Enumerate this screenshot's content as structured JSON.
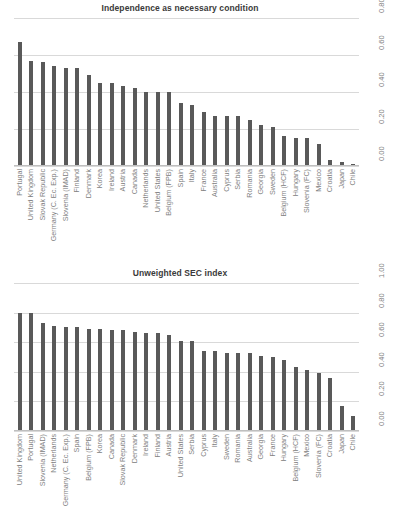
{
  "chart_data": [
    {
      "type": "bar",
      "title": "Independence as necessary condition",
      "xlabel": "",
      "ylabel": "",
      "ylim": [
        0.0,
        0.8
      ],
      "yticks": [
        "0.00",
        "0.20",
        "0.40",
        "0.60",
        "0.80"
      ],
      "ytick_values": [
        0.0,
        0.2,
        0.4,
        0.6,
        0.8
      ],
      "grid": true,
      "legend": "none",
      "bar_color": "#595959",
      "axis_position": "right",
      "categories": [
        "Portugal",
        "United Kingdom",
        "Slovak Republic",
        "Germany (C. Ec. Exp.)",
        "Slovenia (IMAD)",
        "Finland",
        "Denmark",
        "Korea",
        "Ireland",
        "Austria",
        "Canada",
        "Netherlands",
        "United States",
        "Belgium (FPB)",
        "Spain",
        "Italy",
        "France",
        "Australia",
        "Cyprus",
        "Serbia",
        "Romania",
        "Georgia",
        "Sweden",
        "Belgium (HCF)",
        "Hungary",
        "Slovenia (FC)",
        "Mexico",
        "Croatia",
        "Japan",
        "Chile"
      ],
      "values": [
        0.67,
        0.57,
        0.56,
        0.54,
        0.53,
        0.53,
        0.49,
        0.45,
        0.45,
        0.43,
        0.42,
        0.4,
        0.4,
        0.4,
        0.34,
        0.33,
        0.29,
        0.27,
        0.27,
        0.27,
        0.25,
        0.22,
        0.21,
        0.16,
        0.15,
        0.15,
        0.12,
        0.03,
        0.02,
        0.01
      ]
    },
    {
      "type": "bar",
      "title": "Unweighted SEC index",
      "xlabel": "",
      "ylabel": "",
      "ylim": [
        0.0,
        1.0
      ],
      "yticks": [
        "0.00",
        "0.20",
        "0.40",
        "0.60",
        "0.80",
        "1.00"
      ],
      "ytick_values": [
        0.0,
        0.2,
        0.4,
        0.6,
        0.8,
        1.0
      ],
      "grid": true,
      "legend": "none",
      "bar_color": "#595959",
      "axis_position": "right",
      "categories": [
        "United Kingdom",
        "Portugal",
        "Slovenia (IMAD)",
        "Netherlands",
        "Germany (C. Ec. Exp.)",
        "Spain",
        "Belgium (FPB)",
        "Korea",
        "Canada",
        "Slovak Republic",
        "Denmark",
        "Ireland",
        "Finland",
        "Austria",
        "United States",
        "Serbia",
        "Cyprus",
        "Italy",
        "Sweden",
        "Romania",
        "Australia",
        "Georgia",
        "France",
        "Hungary",
        "Belgium (HCF)",
        "Mexico",
        "Slovenia (FC)",
        "Croatia",
        "Japan",
        "Chile"
      ],
      "values": [
        0.8,
        0.8,
        0.73,
        0.71,
        0.7,
        0.7,
        0.69,
        0.69,
        0.68,
        0.68,
        0.67,
        0.66,
        0.66,
        0.65,
        0.61,
        0.61,
        0.54,
        0.54,
        0.53,
        0.53,
        0.53,
        0.51,
        0.5,
        0.48,
        0.43,
        0.41,
        0.39,
        0.36,
        0.17,
        0.1
      ]
    }
  ]
}
